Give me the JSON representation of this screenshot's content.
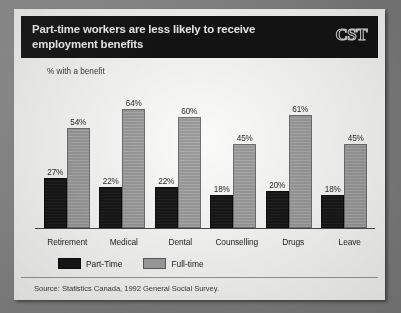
{
  "header": {
    "title": "Part-time workers are less likely to receive employment benefits",
    "logo": "CST"
  },
  "axis_label": "% with a benefit",
  "legend": {
    "items": [
      {
        "label": "Part-Time",
        "color": "#171717"
      },
      {
        "label": "Full-time",
        "color": "#a2a2a2"
      }
    ]
  },
  "source": "Source: Statistics Canada, 1992 General Social Survey.",
  "value_labels": {
    "retirement_part": "27%",
    "retirement_full": "54%",
    "medical_part": "22%",
    "medical_full": "64%",
    "dental_part": "22%",
    "dental_full": "60%",
    "counselling_part": "18%",
    "counselling_full": "45%",
    "drugs_part": "20%",
    "drugs_full": "61%",
    "leave_part": "18%",
    "leave_full": "45%"
  },
  "categories_text": {
    "retirement": "Retirement",
    "medical": "Medical",
    "dental": "Dental",
    "counselling": "Counselling",
    "drugs": "Drugs",
    "leave": "Leave"
  },
  "chart_data": {
    "type": "bar",
    "title": "Part-time workers are less likely to receive employment benefits",
    "subtitle": "",
    "xlabel": "",
    "ylabel": "% with a benefit",
    "ylim": [
      0,
      70
    ],
    "grid": false,
    "legend_position": "bottom-left",
    "categories": [
      "Retirement",
      "Medical",
      "Dental",
      "Counselling",
      "Drugs",
      "Leave"
    ],
    "series": [
      {
        "name": "Part-Time",
        "color": "#171717",
        "values": [
          27,
          22,
          22,
          18,
          20,
          18
        ]
      },
      {
        "name": "Full-time",
        "color": "#a2a2a2",
        "values": [
          54,
          64,
          60,
          45,
          61,
          45
        ]
      }
    ],
    "data_labels": [
      "27%",
      "54%",
      "22%",
      "64%",
      "22%",
      "60%",
      "18%",
      "45%",
      "20%",
      "61%",
      "18%",
      "45%"
    ],
    "annotations": [
      "Source: Statistics Canada, 1992 General Social Survey."
    ]
  }
}
